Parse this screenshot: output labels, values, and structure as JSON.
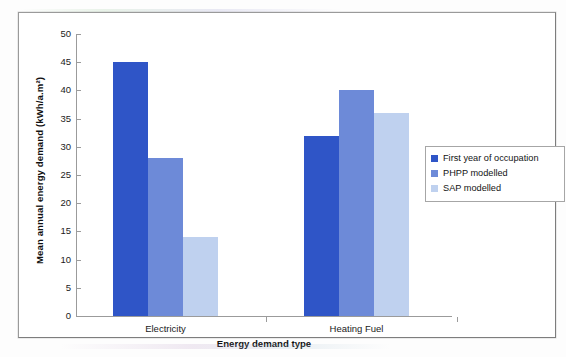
{
  "chart_data": {
    "type": "bar",
    "title": "",
    "xlabel": "Energy demand type",
    "ylabel": "Mean annual energy demand (kWh/a.m²)",
    "categories": [
      "Electricity",
      "Heating Fuel"
    ],
    "series": [
      {
        "name": "First year of occupation",
        "color": "#2f55c7",
        "values": [
          45,
          32
        ]
      },
      {
        "name": "PHPP modelled",
        "color": "#6d8ad8",
        "values": [
          28,
          40
        ]
      },
      {
        "name": "SAP modelled",
        "color": "#bfd1ef",
        "values": [
          14,
          36
        ]
      }
    ],
    "ylim": [
      0,
      50
    ],
    "ytick_step": 5,
    "ytick_labels": [
      "50",
      "45",
      "40",
      "35",
      "30",
      "25",
      "20",
      "15",
      "10",
      "5",
      "0"
    ],
    "grid": false,
    "legend_position": "right",
    "annotations": []
  },
  "legend": {
    "items": [
      {
        "label": "First year of occupation",
        "color": "#2f55c7"
      },
      {
        "label": "PHPP modelled",
        "color": "#6d8ad8"
      },
      {
        "label": "SAP modelled",
        "color": "#bfd1ef"
      }
    ]
  },
  "colors": {
    "series_1": "#2f55c7",
    "series_2": "#6d8ad8",
    "series_3": "#bfd1ef",
    "axis": "#9b9b9b",
    "frame": "#9a9a9a",
    "text": "#1b1b1b"
  }
}
